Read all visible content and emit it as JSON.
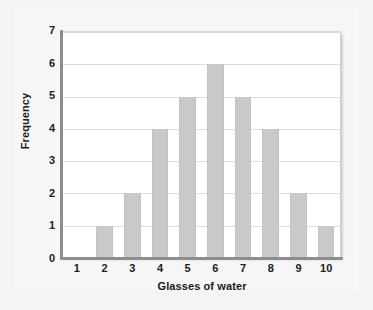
{
  "chart_data": {
    "type": "bar",
    "title": "",
    "subtitle": "",
    "xlabel": "Glasses of water",
    "ylabel": "Frequency",
    "categories": [
      "1",
      "2",
      "3",
      "4",
      "5",
      "6",
      "7",
      "8",
      "9",
      "10"
    ],
    "values": [
      0,
      1,
      2,
      4,
      5,
      6,
      5,
      4,
      2,
      1
    ],
    "series": [
      {
        "name": "Frequency",
        "values": [
          0,
          1,
          2,
          4,
          5,
          6,
          5,
          4,
          2,
          1
        ]
      }
    ],
    "xlim": [
      0.5,
      10.5
    ],
    "ylim": [
      0,
      7
    ],
    "y_ticks": [
      "0",
      "1",
      "2",
      "3",
      "4",
      "5",
      "6",
      "7"
    ],
    "x_ticks": [
      "1",
      "2",
      "3",
      "4",
      "5",
      "6",
      "7",
      "8",
      "9",
      "10"
    ],
    "grid": "horizontal",
    "legend": "none",
    "annotations": [],
    "colors": {
      "bar_fill": "#c9c9c9",
      "bar_edge": "#c2c2c2",
      "gridline": "#dedede",
      "axis_line": "#8d8d8d",
      "plot_background": "#ffffff",
      "page_background": "#f4f4f4",
      "text": "#22201f"
    }
  }
}
